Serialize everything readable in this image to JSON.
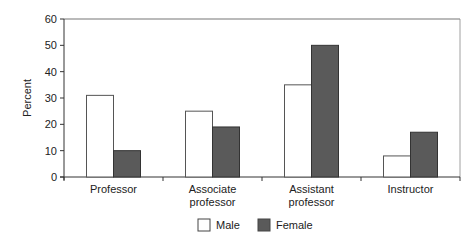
{
  "chart_data": {
    "type": "bar",
    "title": "",
    "xlabel": "",
    "ylabel": "Percent",
    "ylim": [
      0,
      60
    ],
    "yticks": [
      0,
      10,
      20,
      30,
      40,
      50,
      60
    ],
    "categories": [
      [
        "Professor"
      ],
      [
        "Associate",
        "professor"
      ],
      [
        "Assistant",
        "professor"
      ],
      [
        "Instructor"
      ]
    ],
    "series": [
      {
        "name": "Male",
        "values": [
          31,
          25,
          35,
          8
        ],
        "color": "#ffffff"
      },
      {
        "name": "Female",
        "values": [
          10,
          19,
          50,
          17
        ],
        "color": "#5a5a5a"
      }
    ],
    "grid": false,
    "legend": "bottom-center"
  }
}
